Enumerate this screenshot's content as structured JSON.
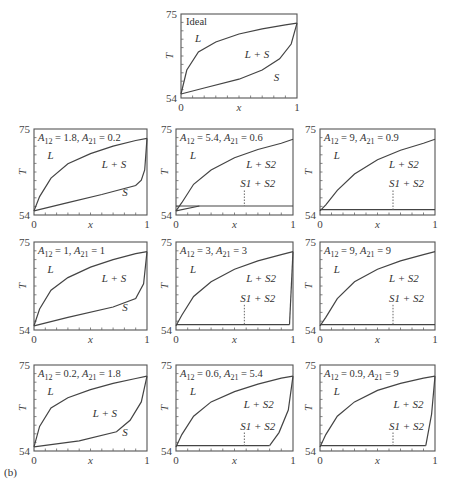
{
  "figure_label": "(b)",
  "axes": {
    "xlabel": "x",
    "ylabel": "T",
    "x_ticks": [
      "0",
      "1"
    ],
    "y_ticks": [
      "54",
      "75"
    ],
    "xlim": [
      0,
      1
    ],
    "ylim": [
      54,
      75
    ]
  },
  "panels": [
    {
      "id": "ideal",
      "title": "Ideal",
      "A12": null,
      "A21": null,
      "labels": [
        "L",
        "L + S",
        "S"
      ]
    },
    {
      "id": "r1c1",
      "A12": "1.8",
      "A21": "0.2",
      "labels": [
        "L",
        "L + S",
        "S"
      ]
    },
    {
      "id": "r1c2",
      "A12": "5.4",
      "A21": "0.6",
      "labels": [
        "L",
        "L + S2",
        "S1 + S2"
      ]
    },
    {
      "id": "r1c3",
      "A12": "9",
      "A21": "0.9",
      "labels": [
        "L",
        "L + S2",
        "S1 + S2"
      ]
    },
    {
      "id": "r2c1",
      "A12": "1",
      "A21": "1",
      "labels": [
        "L",
        "L + S",
        "S"
      ]
    },
    {
      "id": "r2c2",
      "A12": "3",
      "A21": "3",
      "labels": [
        "L",
        "L + S2",
        "S1 + S2"
      ]
    },
    {
      "id": "r2c3",
      "A12": "9",
      "A21": "9",
      "labels": [
        "L",
        "L + S2",
        "S1 + S2"
      ]
    },
    {
      "id": "r3c1",
      "A12": "0.2",
      "A21": "1.8",
      "labels": [
        "L",
        "L + S",
        "S"
      ]
    },
    {
      "id": "r3c2",
      "A12": "0.6",
      "A21": "5.4",
      "labels": [
        "L",
        "L + S2",
        "S1 + S2"
      ]
    },
    {
      "id": "r3c3",
      "A12": "0.9",
      "A21": "9",
      "labels": [
        "L",
        "L + S2",
        "S1 + S2"
      ]
    }
  ],
  "chart_data": [
    {
      "type": "line",
      "title": "Ideal",
      "xlabel": "x",
      "ylabel": "T",
      "xlim": [
        0,
        1
      ],
      "ylim": [
        54,
        75
      ],
      "series": [
        {
          "name": "liquidus",
          "x": [
            0,
            0.05,
            0.15,
            0.3,
            0.5,
            0.7,
            0.9,
            1
          ],
          "y": [
            55,
            61,
            65.5,
            68,
            70,
            71.3,
            72.3,
            72.7
          ]
        },
        {
          "name": "solidus",
          "x": [
            0,
            0.2,
            0.5,
            0.7,
            0.85,
            0.95,
            1
          ],
          "y": [
            55,
            56.5,
            58.7,
            61,
            63.8,
            67.5,
            72.7
          ]
        }
      ],
      "regions": [
        "L",
        "L + S",
        "S"
      ]
    },
    {
      "type": "line",
      "title": "A12 = 1.8, A21 = 0.2",
      "xlim": [
        0,
        1
      ],
      "ylim": [
        54,
        75
      ],
      "series": [
        {
          "name": "liquidus",
          "x": [
            0,
            0.05,
            0.15,
            0.3,
            0.5,
            0.7,
            0.9,
            1
          ],
          "y": [
            55,
            58.5,
            63,
            66.5,
            69,
            70.8,
            72.2,
            72.7
          ]
        },
        {
          "name": "solidus",
          "x": [
            0,
            0.3,
            0.6,
            0.9,
            0.95,
            0.98,
            1
          ],
          "y": [
            55,
            57,
            59,
            61.2,
            62.5,
            65,
            72.7
          ]
        }
      ],
      "regions": [
        "L",
        "L + S",
        "S"
      ]
    },
    {
      "type": "line",
      "title": "A12 = 5.4, A21 = 0.6",
      "xlim": [
        0,
        1
      ],
      "ylim": [
        54,
        75
      ],
      "series": [
        {
          "name": "liquidus",
          "x": [
            0,
            0.05,
            0.15,
            0.3,
            0.5,
            0.7,
            0.9,
            1
          ],
          "y": [
            55,
            57,
            61.5,
            65,
            68,
            70,
            71.5,
            72.5
          ]
        },
        {
          "name": "solidus_S1",
          "x": [
            0,
            0.2
          ],
          "y": [
            55,
            56.2
          ]
        },
        {
          "name": "eutectic",
          "x": [
            0,
            1
          ],
          "y": [
            56.2,
            56.2
          ]
        }
      ],
      "regions": [
        "L",
        "L + S2",
        "S1 + S2"
      ]
    },
    {
      "type": "line",
      "title": "A12 = 9, A21 = 0.9",
      "xlim": [
        0,
        1
      ],
      "ylim": [
        54,
        75
      ],
      "series": [
        {
          "name": "liquidus",
          "x": [
            0,
            0.05,
            0.15,
            0.3,
            0.5,
            0.7,
            0.9,
            1
          ],
          "y": [
            55,
            56.5,
            60,
            64,
            67.5,
            69.8,
            71.5,
            72.5
          ]
        },
        {
          "name": "eutectic",
          "x": [
            0,
            1
          ],
          "y": [
            55.3,
            55.3
          ]
        }
      ],
      "regions": [
        "L",
        "L + S2",
        "S1 + S2"
      ]
    },
    {
      "type": "line",
      "title": "A12 = 1, A21 = 1",
      "xlim": [
        0,
        1
      ],
      "ylim": [
        54,
        75
      ],
      "series": [
        {
          "name": "liquidus",
          "x": [
            0,
            0.05,
            0.15,
            0.3,
            0.5,
            0.7,
            0.9,
            1
          ],
          "y": [
            55,
            59,
            63.5,
            66.5,
            69,
            70.8,
            72.2,
            72.7
          ]
        },
        {
          "name": "solidus",
          "x": [
            0,
            0.3,
            0.7,
            0.9,
            0.97,
            1
          ],
          "y": [
            55,
            57,
            59.5,
            61.5,
            65,
            72.7
          ]
        }
      ],
      "regions": [
        "L",
        "L + S",
        "S"
      ]
    },
    {
      "type": "line",
      "title": "A12 = 3, A21 = 3",
      "xlim": [
        0,
        1
      ],
      "ylim": [
        54,
        75
      ],
      "series": [
        {
          "name": "liquidus",
          "x": [
            0,
            0.05,
            0.15,
            0.3,
            0.5,
            0.7,
            0.9,
            1
          ],
          "y": [
            55,
            57.5,
            62,
            65.5,
            68.5,
            70.5,
            72,
            72.7
          ]
        },
        {
          "name": "eutectic",
          "x": [
            0,
            0.97
          ],
          "y": [
            55.3,
            55.3
          ]
        },
        {
          "name": "S2 liquidus right",
          "x": [
            0.97,
            1
          ],
          "y": [
            55.3,
            72.7
          ]
        }
      ],
      "regions": [
        "L",
        "L + S2",
        "S1 + S2"
      ]
    },
    {
      "type": "line",
      "title": "A12 = 9, A21 = 9",
      "xlim": [
        0,
        1
      ],
      "ylim": [
        54,
        75
      ],
      "series": [
        {
          "name": "liquidus",
          "x": [
            0,
            0.05,
            0.15,
            0.3,
            0.5,
            0.7,
            0.9,
            1
          ],
          "y": [
            55,
            57,
            61.5,
            65.5,
            68.5,
            70.5,
            72,
            72.7
          ]
        },
        {
          "name": "eutectic",
          "x": [
            0,
            1
          ],
          "y": [
            55.3,
            55.3
          ]
        }
      ],
      "regions": [
        "L",
        "L + S2",
        "S1 + S2"
      ]
    },
    {
      "type": "line",
      "title": "A12 = 0.2, A21 = 1.8",
      "xlim": [
        0,
        1
      ],
      "ylim": [
        54,
        75
      ],
      "series": [
        {
          "name": "liquidus",
          "x": [
            0,
            0.05,
            0.15,
            0.3,
            0.5,
            0.7,
            0.9,
            1
          ],
          "y": [
            55,
            60,
            64.5,
            67,
            69,
            70.5,
            71.7,
            72.3
          ]
        },
        {
          "name": "solidus",
          "x": [
            0,
            0.4,
            0.73,
            0.85,
            0.95,
            1
          ],
          "y": [
            55,
            56.5,
            58.7,
            61.5,
            66,
            72.3
          ]
        }
      ],
      "regions": [
        "L",
        "L + S",
        "S"
      ]
    },
    {
      "type": "line",
      "title": "A12 = 0.6, A21 = 5.4",
      "xlim": [
        0,
        1
      ],
      "ylim": [
        54,
        75
      ],
      "series": [
        {
          "name": "liquidus",
          "x": [
            0,
            0.05,
            0.15,
            0.3,
            0.5,
            0.7,
            0.9,
            1
          ],
          "y": [
            55,
            58,
            62.5,
            66,
            68.5,
            70.3,
            71.8,
            72.3
          ]
        },
        {
          "name": "eutectic",
          "x": [
            0,
            0.8
          ],
          "y": [
            55.3,
            55.3
          ]
        },
        {
          "name": "S2 liquidus right",
          "x": [
            0.8,
            0.88,
            0.96,
            1
          ],
          "y": [
            55.3,
            58.5,
            64,
            72.3
          ]
        }
      ],
      "regions": [
        "L",
        "L + S2",
        "S1 + S2"
      ]
    },
    {
      "type": "line",
      "title": "A12 = 0.9, A21 = 9",
      "xlim": [
        0,
        1
      ],
      "ylim": [
        54,
        75
      ],
      "series": [
        {
          "name": "liquidus",
          "x": [
            0,
            0.05,
            0.15,
            0.3,
            0.5,
            0.7,
            0.9,
            1
          ],
          "y": [
            55,
            58,
            62.5,
            66,
            68.8,
            70.5,
            71.8,
            72.3
          ]
        },
        {
          "name": "eutectic",
          "x": [
            0,
            0.92
          ],
          "y": [
            55.3,
            55.3
          ]
        },
        {
          "name": "S2 liquidus right",
          "x": [
            0.92,
            0.97,
            1
          ],
          "y": [
            55.3,
            63,
            72.3
          ]
        }
      ],
      "regions": [
        "L",
        "L + S2",
        "S1 + S2"
      ]
    }
  ]
}
